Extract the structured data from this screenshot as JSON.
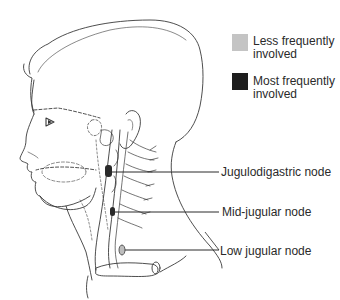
{
  "legend": {
    "items": [
      {
        "label": "Less frequently involved",
        "color": "#c4c4c4"
      },
      {
        "label": "Most frequently involved",
        "color": "#1e1e1e"
      }
    ]
  },
  "labels": {
    "jugulodigastric": "Jugulodigastric node",
    "mid_jugular": "Mid-jugular node",
    "low_jugular": "Low jugular node"
  },
  "colors": {
    "line": "#3a3a3a",
    "node_dark": "#2a2a2a",
    "node_light": "#bdbdbd"
  }
}
